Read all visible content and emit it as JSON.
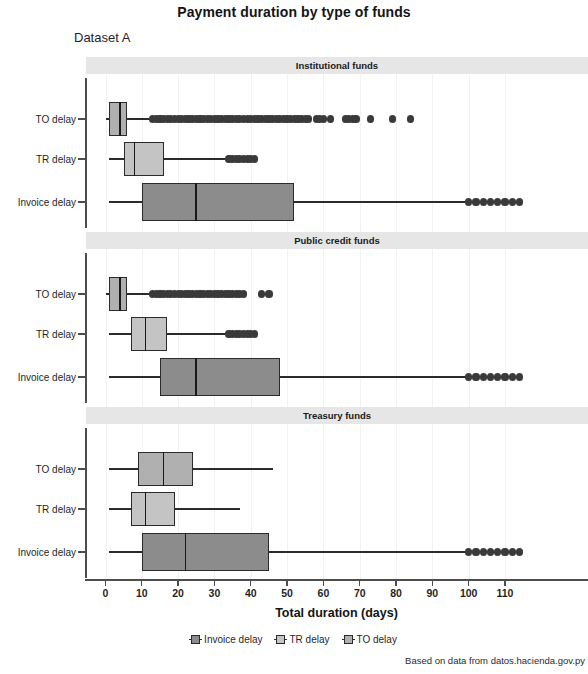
{
  "chart_data": {
    "type": "boxplot",
    "title": "Payment duration by type of funds",
    "subtitle": "Dataset A",
    "xlabel": "Total duration (days)",
    "ylabel": "",
    "caption": "Based on data from datos.hacienda.gov.py",
    "xlim": [
      -4,
      116
    ],
    "xticks": [
      0,
      10,
      20,
      30,
      40,
      50,
      60,
      70,
      80,
      90,
      100,
      110
    ],
    "xticklabels": [
      "0",
      "10",
      "20",
      "30",
      "40",
      "50",
      "60",
      "70",
      "80",
      "90",
      "100",
      "110"
    ],
    "categories": [
      "Invoice delay",
      "TR delay",
      "TO delay"
    ],
    "category_order_top_to_bottom": [
      "TO delay",
      "TR delay",
      "Invoice delay"
    ],
    "grid": true,
    "legend_position": "bottom",
    "colors": {
      "invoice_delay": "#8c8c8c",
      "tr_delay": "#c4c4c4",
      "to_delay": "#b0b0b0",
      "outline": "#2b2b2b",
      "strip_background": "#e6e6e6"
    },
    "legend": [
      {
        "label": "Invoice delay",
        "color": "#8c8c8c"
      },
      {
        "label": "TR delay",
        "color": "#c4c4c4"
      },
      {
        "label": "TO delay",
        "color": "#b0b0b0"
      }
    ],
    "facets": [
      {
        "name": "Institutional funds",
        "boxes": [
          {
            "category": "TO delay",
            "color": "#b0b0b0",
            "whisker_low": 0,
            "q1": 1,
            "median": 4,
            "q3": 6,
            "whisker_high": 12,
            "outliers": [
              13,
              14,
              15,
              16,
              17,
              18,
              19,
              20,
              21,
              22,
              23,
              24,
              25,
              26,
              27,
              28,
              29,
              30,
              31,
              32,
              33,
              34,
              35,
              36,
              37,
              38,
              39,
              40,
              41,
              42,
              43,
              44,
              45,
              46,
              47,
              48,
              49,
              50,
              51,
              52,
              53,
              54,
              55,
              56,
              58,
              59,
              60,
              62,
              66,
              67,
              68,
              69,
              73,
              79,
              84
            ]
          },
          {
            "category": "TR delay",
            "color": "#c4c4c4",
            "whisker_low": 1,
            "q1": 5,
            "median": 8,
            "q3": 16,
            "whisker_high": 34,
            "outliers": [
              34,
              35,
              36,
              37,
              38,
              39,
              40,
              41
            ]
          },
          {
            "category": "Invoice delay",
            "color": "#8c8c8c",
            "whisker_low": 1,
            "q1": 10,
            "median": 25,
            "q3": 52,
            "whisker_high": 114,
            "outliers": [
              100,
              102,
              104,
              106,
              108,
              110,
              112,
              114
            ]
          }
        ]
      },
      {
        "name": "Public credit funds",
        "boxes": [
          {
            "category": "TO delay",
            "color": "#b0b0b0",
            "whisker_low": 0,
            "q1": 1,
            "median": 4,
            "q3": 6,
            "whisker_high": 12,
            "outliers": [
              13,
              14,
              15,
              16,
              17,
              18,
              19,
              20,
              21,
              22,
              23,
              24,
              25,
              26,
              27,
              28,
              29,
              30,
              31,
              32,
              33,
              34,
              35,
              36,
              37,
              38,
              43,
              45
            ]
          },
          {
            "category": "TR delay",
            "color": "#c4c4c4",
            "whisker_low": 1,
            "q1": 7,
            "median": 11,
            "q3": 17,
            "whisker_high": 34,
            "outliers": [
              34,
              35,
              36,
              37,
              38,
              39,
              40,
              41
            ]
          },
          {
            "category": "Invoice delay",
            "color": "#8c8c8c",
            "whisker_low": 1,
            "q1": 15,
            "median": 25,
            "q3": 48,
            "whisker_high": 114,
            "outliers": [
              100,
              102,
              104,
              106,
              108,
              110,
              112,
              114
            ]
          }
        ]
      },
      {
        "name": "Treasury funds",
        "boxes": [
          {
            "category": "TO delay",
            "color": "#b0b0b0",
            "whisker_low": 1,
            "q1": 9,
            "median": 16,
            "q3": 24,
            "whisker_high": 46,
            "outliers": []
          },
          {
            "category": "TR delay",
            "color": "#c4c4c4",
            "whisker_low": 1,
            "q1": 7,
            "median": 11,
            "q3": 19,
            "whisker_high": 37,
            "outliers": []
          },
          {
            "category": "Invoice delay",
            "color": "#8c8c8c",
            "whisker_low": 1,
            "q1": 10,
            "median": 22,
            "q3": 45,
            "whisker_high": 114,
            "outliers": [
              100,
              102,
              104,
              106,
              108,
              110,
              112,
              114
            ]
          }
        ]
      }
    ]
  }
}
